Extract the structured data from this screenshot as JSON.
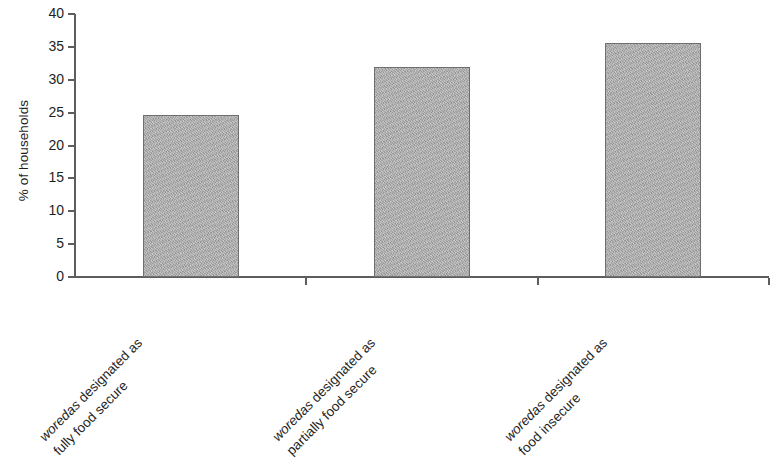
{
  "chart_data": {
    "type": "bar",
    "title": "",
    "subtitle": "",
    "xlabel": "",
    "ylabel": "% of households",
    "categories": [
      "woredas designated as fully food secure",
      "woredas designated as partially food secure",
      "woredas designated as food insecure"
    ],
    "category_lines": [
      {
        "emphasis": "woredas",
        "line1_rest": " designated as",
        "line2": "fully food secure"
      },
      {
        "emphasis": "woredas",
        "line1_rest": " designated as",
        "line2": "partially food secure"
      },
      {
        "emphasis": "woredas",
        "line1_rest": " designated as",
        "line2": "food insecure"
      }
    ],
    "values": [
      24.7,
      32.0,
      35.6
    ],
    "ylim": [
      0,
      40
    ],
    "ytick_labels": [
      "0",
      "5",
      "10",
      "15",
      "20",
      "25",
      "30",
      "35",
      "40"
    ],
    "ytick_values": [
      0,
      5,
      10,
      15,
      20,
      25,
      30,
      35,
      40
    ],
    "ytick_step": 5,
    "grid": "off",
    "legend": "none",
    "bar_fill_color": "#a9a9a9",
    "bar_edge_color": "#6f6f6f",
    "axis_color": "#5d5d5d",
    "background_color": "#ffffff",
    "label_rotation_degrees": -45
  }
}
